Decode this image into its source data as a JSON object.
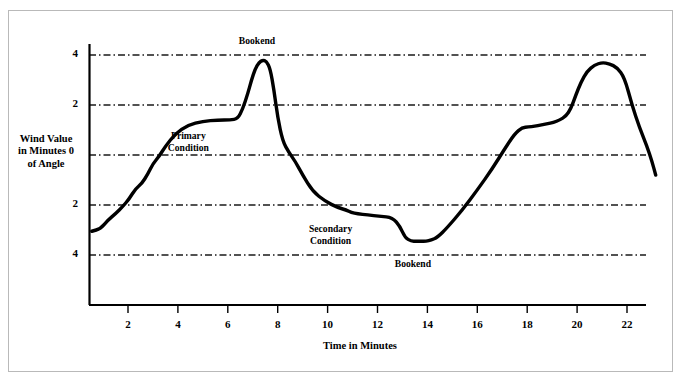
{
  "chart_data": {
    "type": "line",
    "title": "",
    "xlabel": "Time in Minutes",
    "ylabel": "Wind Value\nin Minutes\nof Angle",
    "ylabel_lines": [
      "Wind Value",
      "in Minutes",
      "of Angle"
    ],
    "xlim": [
      0.5,
      23.2
    ],
    "ylim": [
      -4.8,
      4.6
    ],
    "grid": true,
    "grid_style": "dash-dot",
    "legend": "none",
    "xticks": [
      2,
      4,
      6,
      8,
      10,
      12,
      14,
      16,
      18,
      20,
      22
    ],
    "xtick_labels": [
      "2",
      "4",
      "6",
      "8",
      "10",
      "12",
      "14",
      "16",
      "18",
      "20",
      "22"
    ],
    "yticks": [
      4,
      2,
      0,
      -2,
      -4
    ],
    "ytick_labels": [
      "4",
      "2",
      "0",
      "2",
      "4"
    ],
    "line_color": "#000000",
    "line_width": 3.4,
    "series": [
      {
        "name": "Wind Value",
        "x": [
          0.55,
          0.9,
          1.2,
          1.5,
          1.8,
          2.05,
          2.3,
          2.55,
          2.8,
          3.0,
          3.25,
          3.5,
          3.9,
          4.4,
          5.0,
          5.6,
          6.1,
          6.4,
          6.6,
          6.8,
          6.95,
          7.1,
          7.25,
          7.4,
          7.55,
          7.7,
          7.85,
          8.0,
          8.2,
          8.45,
          8.7,
          9.0,
          9.4,
          9.9,
          10.4,
          10.75,
          10.95,
          11.2,
          11.6,
          12.1,
          12.6,
          12.9,
          13.1,
          13.35,
          13.55,
          13.75,
          13.95,
          14.15,
          14.4,
          14.8,
          15.4,
          16.0,
          16.6,
          17.1,
          17.5,
          17.8,
          18.05,
          18.3,
          18.55,
          18.8,
          19.05,
          19.3,
          19.55,
          19.75,
          19.95,
          20.15,
          20.4,
          20.7,
          21.0,
          21.3,
          21.6,
          21.9,
          22.2,
          22.5,
          22.8,
          23.0,
          23.15
        ],
        "y": [
          -3.05,
          -2.95,
          -2.6,
          -2.35,
          -2.05,
          -1.75,
          -1.35,
          -1.15,
          -0.75,
          -0.35,
          -0.05,
          0.35,
          0.85,
          1.2,
          1.35,
          1.4,
          1.4,
          1.45,
          1.85,
          2.45,
          3.0,
          3.45,
          3.7,
          3.8,
          3.75,
          3.45,
          2.6,
          1.5,
          0.55,
          0.1,
          -0.25,
          -0.8,
          -1.45,
          -1.85,
          -2.1,
          -2.2,
          -2.3,
          -2.35,
          -2.4,
          -2.45,
          -2.5,
          -2.85,
          -3.3,
          -3.45,
          -3.45,
          -3.45,
          -3.45,
          -3.4,
          -3.3,
          -2.9,
          -2.2,
          -1.4,
          -0.55,
          0.25,
          0.85,
          1.1,
          1.12,
          1.15,
          1.2,
          1.25,
          1.3,
          1.4,
          1.55,
          1.85,
          2.4,
          2.9,
          3.35,
          3.6,
          3.7,
          3.65,
          3.5,
          3.1,
          2.0,
          1.1,
          0.35,
          -0.25,
          -0.8
        ]
      }
    ],
    "annotations": [
      {
        "text": "Bookend",
        "x": 7.05,
        "y": 4.55,
        "position": "top-peak"
      },
      {
        "text": "Primary\nCondition",
        "lines": [
          "Primary",
          "Condition"
        ],
        "x": 4.3,
        "y": 0.75,
        "position": "mid-left"
      },
      {
        "text": "Secondary\nCondition",
        "lines": [
          "Secondary",
          "Condition"
        ],
        "x": 10.0,
        "y": -2.95,
        "position": "mid-center"
      },
      {
        "text": "Bookend",
        "x": 13.3,
        "y": -4.35,
        "position": "bottom-trough"
      }
    ]
  },
  "colors": {
    "line": "#000000",
    "grid": "#1a1a1a",
    "axis": "#000000",
    "frame": "#b9b9b9",
    "background": "#ffffff"
  }
}
